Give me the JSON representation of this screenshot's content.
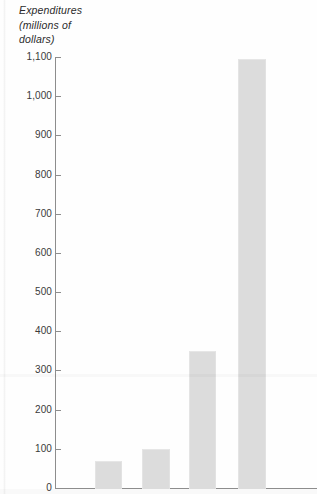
{
  "chart_data": {
    "type": "bar",
    "title": "Expenditures (millions of dollars)",
    "title_lines": [
      "Expenditures",
      "(millions of",
      "dollars)"
    ],
    "xlabel": "",
    "ylabel": "Expenditures (millions of dollars)",
    "ylim": [
      0,
      1100
    ],
    "grid": false,
    "legend": null,
    "categories": [
      "",
      "",
      "",
      ""
    ],
    "values": [
      70,
      100,
      350,
      1095
    ],
    "ytick_values": [
      0,
      100,
      200,
      300,
      400,
      500,
      600,
      700,
      800,
      900,
      1000,
      1100
    ],
    "ytick_labels": [
      "0",
      "100",
      "200",
      "300",
      "400",
      "500",
      "600",
      "700",
      "800",
      "900",
      "1,000",
      "1,100"
    ],
    "bar_color": "#dcdcdc",
    "axis_color": "#8d8d8d",
    "note": "Scanned bar chart, cropped: x-axis category labels are not visible in the image."
  },
  "ticks": [
    {
      "label": "1,100",
      "value": 1100
    },
    {
      "label": "1,000",
      "value": 1000
    },
    {
      "label": "900",
      "value": 900
    },
    {
      "label": "800",
      "value": 800
    },
    {
      "label": "700",
      "value": 700
    },
    {
      "label": "600",
      "value": 600
    },
    {
      "label": "500",
      "value": 500
    },
    {
      "label": "400",
      "value": 400
    },
    {
      "label": "300",
      "value": 300
    },
    {
      "label": "200",
      "value": 200
    },
    {
      "label": "100",
      "value": 100
    },
    {
      "label": "0",
      "value": 0
    }
  ],
  "bars": [
    {
      "value": 70,
      "left": 95,
      "width": 25
    },
    {
      "value": 100,
      "left": 142,
      "width": 26
    },
    {
      "value": 350,
      "left": 189,
      "width": 25
    },
    {
      "value": 1095,
      "left": 238,
      "width": 26
    }
  ]
}
